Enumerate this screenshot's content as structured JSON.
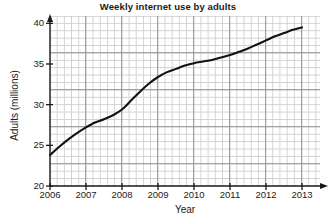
{
  "chart_data": {
    "type": "line",
    "title": "Weekly internet use by adults",
    "xlabel": "Year",
    "ylabel": "Adults (millions)",
    "xlim": [
      2006,
      2013.5
    ],
    "ylim": [
      20,
      40.9
    ],
    "grid": true,
    "legend": "none",
    "xticks": [
      2006,
      2007,
      2008,
      2009,
      2010,
      2011,
      2012,
      2013
    ],
    "xtick_labels": [
      "2006",
      "2007",
      "2008",
      "2009",
      "2010",
      "2011",
      "2012",
      "2013"
    ],
    "yticks": [
      20,
      25,
      30,
      35,
      40
    ],
    "ytick_labels": [
      "20",
      "25",
      "30",
      "35",
      "40"
    ],
    "series": [
      {
        "name": "Adults using internet weekly",
        "x": [
          2006,
          2006.25,
          2006.5,
          2006.75,
          2007,
          2007.25,
          2007.5,
          2007.75,
          2008,
          2008.25,
          2008.5,
          2008.75,
          2009,
          2009.25,
          2009.5,
          2009.75,
          2010,
          2010.25,
          2010.5,
          2010.75,
          2011,
          2011.25,
          2011.5,
          2011.75,
          2012,
          2012.25,
          2012.5,
          2012.75,
          2013
        ],
        "values": [
          23.8,
          24.8,
          25.7,
          26.5,
          27.2,
          27.8,
          28.2,
          28.7,
          29.4,
          30.5,
          31.6,
          32.6,
          33.4,
          34.0,
          34.4,
          34.8,
          35.1,
          35.3,
          35.5,
          35.8,
          36.1,
          36.5,
          36.9,
          37.4,
          37.9,
          38.4,
          38.8,
          39.2,
          39.5
        ]
      }
    ],
    "curve_color": "#111111",
    "grid_minor_color": "#c9c9c9",
    "grid_major_color": "#8c8c8c",
    "axis_color": "#1a1a1a"
  }
}
